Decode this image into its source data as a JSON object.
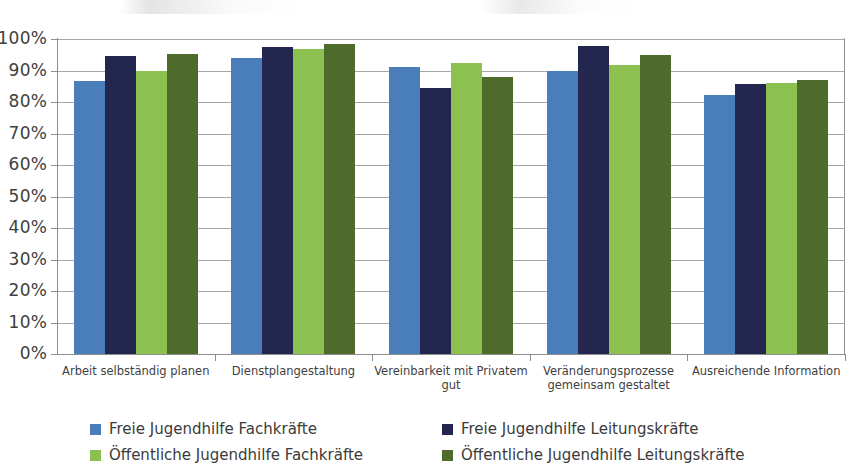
{
  "chart_data": {
    "type": "bar",
    "title": "",
    "subtitle": "",
    "xlabel": "",
    "ylabel": "",
    "ylim": [
      0,
      100
    ],
    "y_unit": "%",
    "grid": true,
    "legend_position": "bottom",
    "y_ticks": [
      "0%",
      "10%",
      "20%",
      "30%",
      "40%",
      "50%",
      "60%",
      "70%",
      "80%",
      "90%",
      "100%"
    ],
    "y_tick_values": [
      0,
      10,
      20,
      30,
      40,
      50,
      60,
      70,
      80,
      90,
      100
    ],
    "categories": [
      "Arbeit selbständig planen",
      "Dienstplangestaltung",
      "Vereinbarkeit mit Privatem gut",
      "Veränderungsprozesse gemeinsam gestaltet",
      "Ausreichende Information"
    ],
    "series": [
      {
        "name": "Freie Jugendhilfe Fachkräfte",
        "color": "#4a7ebb",
        "values": [
          86.6,
          94.1,
          91.2,
          89.7,
          82.1
        ]
      },
      {
        "name": "Freie Jugendhilfe Leitungskräfte",
        "color": "#23264e",
        "values": [
          94.7,
          97.6,
          84.6,
          97.7,
          85.8
        ]
      },
      {
        "name": "Öffentliche Jugendhilfe Fachkräfte",
        "color": "#8cc152",
        "values": [
          90.0,
          96.9,
          92.4,
          91.6,
          86.1
        ]
      },
      {
        "name": "Öffentliche Jugendhilfe Leitungskräfte",
        "color": "#4f6b2b",
        "values": [
          95.3,
          98.5,
          87.8,
          94.8,
          87.1
        ]
      }
    ]
  },
  "legend": {
    "items": [
      {
        "label": "Freie Jugendhilfe Fachkräfte",
        "series": 0
      },
      {
        "label": "Freie Jugendhilfe Leitungskräfte",
        "series": 1
      },
      {
        "label": "Öffentliche Jugendhilfe Fachkräfte",
        "series": 2
      },
      {
        "label": "Öffentliche Jugendhilfe Leitungskräfte",
        "series": 3
      }
    ]
  }
}
